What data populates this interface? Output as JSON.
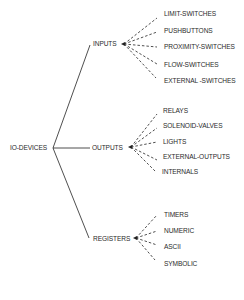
{
  "diagram": {
    "type": "tree",
    "root": {
      "label": "IO-DEVICES",
      "children": [
        {
          "label": "INPUTS",
          "children": [
            "LIMIT-SWITCHES",
            "PUSHBUTTONS",
            "PROXIMITY-SWITCHES",
            "FLOW-SWITCHES",
            "EXTERNAL -SWITCHES"
          ]
        },
        {
          "label": "OUTPUTS",
          "children": [
            "RELAYS",
            "SOLENOID-VALVES",
            "LIGHTS",
            "EXTERNAL-OUTPUTS",
            "INTERNALS"
          ]
        },
        {
          "label": "REGISTERS",
          "children": [
            "TIMERS",
            "NUMERIC",
            "ASCII",
            "SYMBOLIC"
          ]
        }
      ]
    },
    "line_color": "#222222",
    "text_color": "#2a2a2a"
  }
}
